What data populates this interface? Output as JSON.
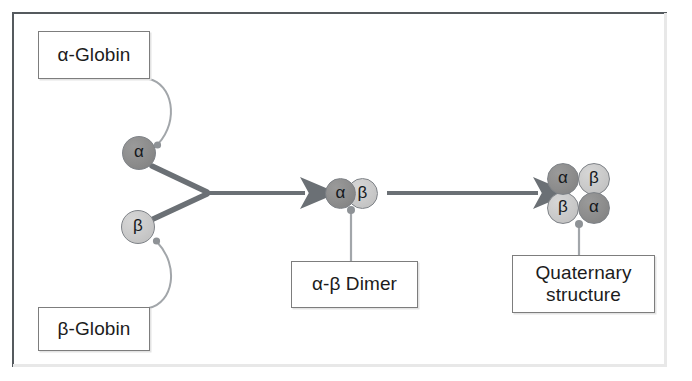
{
  "diagram": {
    "colors": {
      "frame_border": "#555a5e",
      "box_border": "#7d7d7d",
      "arrow": "#6b7075",
      "connector": "#9a9ea2",
      "alpha_fill": "#8c8c8c",
      "beta_fill": "#c9c9c9",
      "text": "#1c1c1c"
    },
    "labels": {
      "alpha_globin": "α-Globin",
      "beta_globin": "β-Globin",
      "dimer": "α-β Dimer",
      "quaternary_line1": "Quaternary",
      "quaternary_line2": "structure"
    },
    "subunits": {
      "alpha_glyph": "α",
      "beta_glyph": "β",
      "free_monomers": [
        {
          "id": "mono-alpha",
          "type": "alpha",
          "glyph": "α"
        },
        {
          "id": "mono-beta",
          "type": "beta",
          "glyph": "β"
        }
      ],
      "dimer": [
        {
          "id": "dimer-alpha",
          "type": "alpha",
          "glyph": "α"
        },
        {
          "id": "dimer-beta",
          "type": "beta",
          "glyph": "β"
        }
      ],
      "tetramer": [
        {
          "id": "tet-alpha-tl",
          "type": "alpha",
          "glyph": "α",
          "position": "top-left"
        },
        {
          "id": "tet-beta-tr",
          "type": "beta",
          "glyph": "β",
          "position": "top-right"
        },
        {
          "id": "tet-beta-bl",
          "type": "beta",
          "glyph": "β",
          "position": "bottom-left"
        },
        {
          "id": "tet-alpha-br",
          "type": "alpha",
          "glyph": "α",
          "position": "bottom-right"
        }
      ]
    },
    "arrows": [
      {
        "name": "merge-arrow",
        "from": [
          "alpha monomer",
          "beta monomer"
        ],
        "to": "alpha-beta dimer"
      },
      {
        "name": "assembly-arrow",
        "from": "alpha-beta dimer",
        "to": "quaternary structure"
      }
    ],
    "leader_lines": [
      {
        "name": "alpha-globin-leader",
        "box": "α-Globin",
        "target": "alpha monomer"
      },
      {
        "name": "beta-globin-leader",
        "box": "β-Globin",
        "target": "beta monomer"
      },
      {
        "name": "dimer-leader",
        "box": "α-β Dimer",
        "target": "alpha-beta dimer"
      },
      {
        "name": "quaternary-leader",
        "box": "Quaternary structure",
        "target": "tetramer"
      }
    ]
  }
}
